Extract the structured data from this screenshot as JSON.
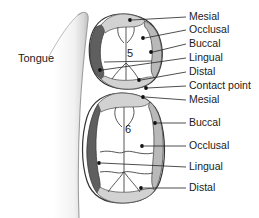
{
  "figure": {
    "tongue_label": "Tongue",
    "colors": {
      "lingual_band": "#5f5f5f",
      "buccal_band": "#b9b9b9",
      "mesial_distal_band": "#d2d2d2",
      "enamel_fill": "#ffffff",
      "outline": "#333333",
      "leader": "#222222",
      "text": "#1a1a1a",
      "tongue_light": "#ffffff",
      "tongue_shadow": "#cfcfcf"
    }
  },
  "teeth": [
    {
      "number": "5",
      "name": "second-premolar",
      "surfaces": [
        "Mesial",
        "Occlusal",
        "Buccal",
        "Lingual",
        "Distal"
      ]
    },
    {
      "number": "6",
      "name": "first-molar",
      "surfaces": [
        "Mesial",
        "Buccal",
        "Occlusal",
        "Lingual",
        "Distal"
      ]
    }
  ],
  "labels": [
    {
      "id": "mesial-5",
      "text": "Mesial",
      "x": 189,
      "y": 20,
      "leader": "M 168,17 L 186,17"
    },
    {
      "id": "occlusal-5",
      "text": "Occlusal",
      "x": 189,
      "y": 33,
      "leader": "M 158,30 L 186,30"
    },
    {
      "id": "buccal-5",
      "text": "Buccal",
      "x": 189,
      "y": 47,
      "leader": "M 163,44 L 186,44"
    },
    {
      "id": "lingual-5",
      "text": "Lingual",
      "x": 189,
      "y": 61,
      "leader": "M 102,70 L 186,58"
    },
    {
      "id": "distal-5",
      "text": "Distal",
      "x": 189,
      "y": 75,
      "leader": "M 158,73 L 186,72"
    },
    {
      "id": "contact-point",
      "text": "Contact point",
      "x": 189,
      "y": 89,
      "leader": "M 146,88 L 186,86"
    },
    {
      "id": "mesial-6",
      "text": "Mesial",
      "x": 189,
      "y": 103,
      "leader": "M 153,96 L 186,100"
    },
    {
      "id": "buccal-6",
      "text": "Buccal",
      "x": 189,
      "y": 126,
      "leader": "M 163,123 L 186,123"
    },
    {
      "id": "occlusal-6",
      "text": "Occlusal",
      "x": 189,
      "y": 149,
      "leader": "M 152,146 L 186,146"
    },
    {
      "id": "lingual-6",
      "text": "Lingual",
      "x": 189,
      "y": 170,
      "leader": "M 101,163 L 186,167"
    },
    {
      "id": "distal-6",
      "text": "Distal",
      "x": 189,
      "y": 191,
      "leader": "M 158,188 L 186,188"
    }
  ],
  "marker_dots": [
    {
      "id": "dot-mesial-5",
      "x": 130,
      "y": 20
    },
    {
      "id": "dot-occlusal-5",
      "x": 143,
      "y": 38
    },
    {
      "id": "dot-buccal-5",
      "x": 151,
      "y": 52
    },
    {
      "id": "dot-lingual-5",
      "x": 100,
      "y": 70
    },
    {
      "id": "dot-distal-5",
      "x": 139,
      "y": 80
    },
    {
      "id": "dot-contact",
      "x": 146,
      "y": 88
    },
    {
      "id": "dot-mesial-6",
      "x": 143,
      "y": 97
    },
    {
      "id": "dot-buccal-6",
      "x": 155,
      "y": 123
    },
    {
      "id": "dot-occlusal-6",
      "x": 142,
      "y": 146
    },
    {
      "id": "dot-lingual-6",
      "x": 99,
      "y": 163
    },
    {
      "id": "dot-distal-6",
      "x": 141,
      "y": 188
    }
  ],
  "tooth_numbers": [
    {
      "id": "num-5",
      "text": "5",
      "x": 130,
      "y": 57
    },
    {
      "id": "num-6",
      "text": "6",
      "x": 128,
      "y": 133
    }
  ]
}
